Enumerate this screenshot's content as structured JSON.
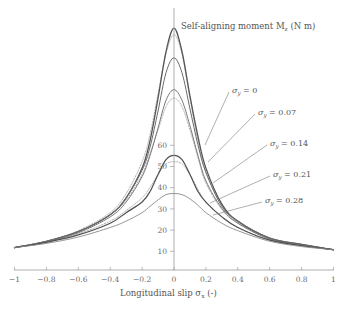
{
  "chart_data": {
    "type": "line",
    "title": "",
    "xlabel": "Longitudinal slip σx (-)",
    "ylabel": "Self-aligning moment Mz (N m)",
    "xlim": [
      -1,
      1
    ],
    "ylim": [
      0,
      120
    ],
    "grid": false,
    "x_ticks": [
      -1,
      -0.8,
      -0.6,
      -0.4,
      -0.2,
      0,
      0.2,
      0.4,
      0.6,
      0.8,
      1
    ],
    "x_tick_labels": [
      "−1",
      "−0.8",
      "−0.6",
      "−0.4",
      "−0.2",
      "0",
      "0.2",
      "0.4",
      "0.6",
      "0.8",
      "1"
    ],
    "y_ticks": [
      10,
      20,
      30,
      40,
      50,
      60
    ],
    "y_tick_labels": [
      "10",
      "20",
      "30",
      "40",
      "50",
      "60"
    ],
    "x": [
      -1,
      -0.8,
      -0.6,
      -0.4,
      -0.3,
      -0.2,
      -0.15,
      -0.1,
      -0.05,
      0,
      0.05,
      0.1,
      0.15,
      0.2,
      0.3,
      0.4,
      0.6,
      0.8,
      1
    ],
    "series": [
      {
        "name": "σy = 0",
        "style": "solid",
        "width": 1.3,
        "color": "#555555",
        "values": [
          11.5,
          14.5,
          19,
          27,
          35,
          49,
          62,
          82,
          104,
          115,
          104,
          83,
          64,
          49,
          32,
          24,
          16,
          13,
          10.5
        ]
      },
      {
        "name": "σy = 0.07",
        "style": "solid",
        "width": 1.0,
        "color": "#6a6a6a",
        "values": [
          11.5,
          14.5,
          19,
          27,
          35,
          48,
          59,
          76,
          94,
          101,
          94,
          77,
          60,
          47,
          31,
          24,
          16,
          13,
          10.5
        ]
      },
      {
        "name": "σy = 0.14",
        "style": "solid",
        "width": 1.0,
        "color": "#7a7a7a",
        "values": [
          11.5,
          14.3,
          18.5,
          26,
          33,
          45,
          55,
          68,
          81,
          86,
          81,
          69,
          55,
          43,
          30,
          23,
          15.5,
          12.5,
          10.5
        ]
      },
      {
        "name": "σy = 0.21",
        "style": "solid",
        "width": 1.2,
        "color": "#505050",
        "values": [
          11.5,
          14,
          17.5,
          23,
          28,
          33,
          38,
          46,
          53,
          55,
          53,
          46,
          38,
          33,
          26,
          21,
          15,
          12.5,
          10.5
        ]
      },
      {
        "name": "σy = 0.28",
        "style": "solid",
        "width": 0.9,
        "color": "#8a8a8a",
        "values": [
          11.5,
          13.5,
          16.5,
          21,
          24,
          28,
          31,
          34,
          36.5,
          37,
          36.5,
          34.5,
          31.5,
          28,
          23,
          19.5,
          14.5,
          12,
          10.5
        ]
      },
      {
        "name": "σy = 0 (measured)",
        "style": "dashed",
        "width": 0.8,
        "color": "#a0a0a0",
        "values": [
          11.5,
          14.5,
          19.5,
          28,
          37,
          52,
          65,
          84,
          103,
          112,
          103,
          82,
          62,
          47,
          31,
          23.5,
          16,
          13,
          10.5
        ]
      },
      {
        "name": "σy = 0.14 (measured)",
        "style": "dashed",
        "width": 0.8,
        "color": "#a0a0a0",
        "values": [
          11.5,
          14.3,
          19,
          27,
          34,
          46,
          56,
          67,
          78,
          82,
          78,
          67,
          54,
          42,
          29.5,
          23,
          15.5,
          12.5,
          10.5
        ]
      },
      {
        "name": "σy = 0.21 (measured)",
        "style": "dashed",
        "width": 0.8,
        "color": "#a0a0a0",
        "values": [
          11.5,
          14,
          18,
          24,
          29,
          35,
          40,
          46,
          51,
          52,
          51,
          46,
          39,
          33,
          26,
          21,
          15,
          12.5,
          10.5
        ]
      }
    ],
    "annotations": [
      {
        "text_main": "σ",
        "text_sub": "y",
        "text_rest": " = 0",
        "label_x": 232,
        "label_y": 93,
        "line_to": [
          205,
          145
        ]
      },
      {
        "text_main": "σ",
        "text_sub": "y",
        "text_rest": " = 0.07",
        "label_x": 258,
        "label_y": 115,
        "line_to": [
          208,
          162
        ]
      },
      {
        "text_main": "σ",
        "text_sub": "y",
        "text_rest": " = 0.14",
        "label_x": 270,
        "label_y": 146,
        "line_to": [
          213,
          183
        ]
      },
      {
        "text_main": "σ",
        "text_sub": "y",
        "text_rest": " = 0.21",
        "label_x": 273,
        "label_y": 177,
        "line_to": [
          210,
          203
        ]
      },
      {
        "text_main": "σ",
        "text_sub": "y",
        "text_rest": " = 0.28",
        "label_x": 265,
        "label_y": 203,
        "line_to": [
          213,
          215
        ]
      }
    ]
  },
  "labels": {
    "y_axis_title": "Self-aligning moment M",
    "y_axis_title_sub": "z",
    "y_axis_title_unit": " (N m)",
    "x_axis_title": "Longitudinal slip σ",
    "x_axis_title_sub": "x",
    "x_axis_title_unit": " (-)"
  }
}
